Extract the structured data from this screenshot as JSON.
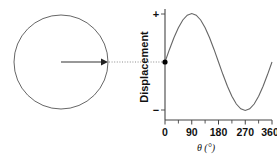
{
  "figure": {
    "name": "circular-motion-to-sine-wave",
    "colors": {
      "stroke": "#555555",
      "axis": "#444444",
      "text": "#111111",
      "marker": "#000000",
      "background": "#ffffff"
    }
  },
  "circle_diagram": {
    "label": "rotating-radius-circle",
    "radius_arrow_label": "",
    "center_x": 61,
    "center_y": 62,
    "radius": 47
  },
  "connector": {
    "style": "dotted",
    "label": ""
  },
  "chart_data": {
    "type": "line",
    "title": "",
    "subtitle": "",
    "xlabel": "θ (°)",
    "ylabel": "Displacement",
    "x": [
      0,
      15,
      30,
      45,
      60,
      75,
      90,
      105,
      120,
      135,
      150,
      165,
      180,
      195,
      210,
      225,
      240,
      255,
      270,
      285,
      300,
      315,
      330,
      345,
      360
    ],
    "values": [
      0,
      0.259,
      0.5,
      0.707,
      0.866,
      0.966,
      1,
      0.966,
      0.866,
      0.707,
      0.5,
      0.259,
      0,
      -0.259,
      -0.5,
      -0.707,
      -0.866,
      -0.966,
      -1,
      -0.966,
      -0.866,
      -0.707,
      -0.5,
      -0.259,
      0
    ],
    "series": [
      {
        "name": "Displacement",
        "values": [
          0,
          0.259,
          0.5,
          0.707,
          0.866,
          0.966,
          1,
          0.966,
          0.866,
          0.707,
          0.5,
          0.259,
          0,
          -0.259,
          -0.5,
          -0.707,
          -0.866,
          -0.966,
          -1,
          -0.966,
          -0.866,
          -0.707,
          -0.5,
          -0.259,
          0
        ]
      }
    ],
    "xlim": [
      0,
      360
    ],
    "ylim": [
      -1.15,
      1.15
    ],
    "xticks": [
      0,
      90,
      180,
      270,
      360
    ],
    "xtick_labels": [
      "0",
      "90",
      "180",
      "270",
      "360"
    ],
    "minor_xticks": [
      45,
      135,
      225,
      315
    ],
    "yticks": [
      1,
      -1
    ],
    "ytick_labels": [
      "+",
      "−"
    ],
    "grid": false,
    "legend": false,
    "legend_position": "none",
    "annotations": [
      {
        "name": "start-point-marker",
        "x": 0,
        "y": 0,
        "label": ""
      }
    ]
  },
  "axis_labels": {
    "y_plus": "+",
    "y_minus": "−",
    "y_title": "Displacement",
    "x_title": "θ (°)",
    "x0": "0",
    "x90": "90",
    "x180": "180",
    "x270": "270",
    "x360": "360"
  }
}
